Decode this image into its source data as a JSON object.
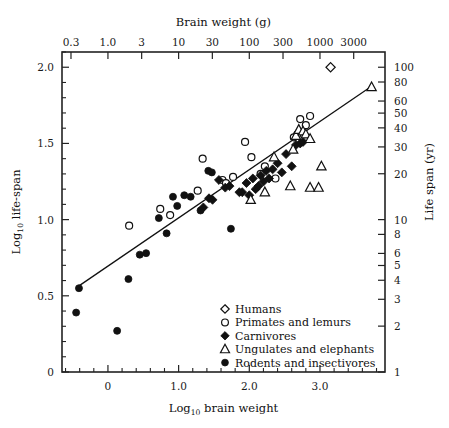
{
  "figure": {
    "background": "#ffffff",
    "ink_color": "#111111"
  },
  "axes": {
    "top": {
      "title": "Brain weight (g)",
      "tick_labels": [
        "0.3",
        "1.0",
        "3",
        "10",
        "30",
        "100",
        "300",
        "1000",
        "3000"
      ],
      "tick_values": [
        0.3,
        1.0,
        3,
        10,
        30,
        100,
        300,
        1000,
        3000
      ],
      "scale": "log10",
      "position": "top"
    },
    "bottom": {
      "title_prefix": "Log",
      "title_sub": "10",
      "title_suffix": " brain weight",
      "title": "Log10 brain weight",
      "tick_labels": [
        "0",
        "1.0",
        "2.0",
        "3.0"
      ],
      "tick_values": [
        0,
        1.0,
        2.0,
        3.0
      ],
      "minor_step": 0.2,
      "range": [
        -0.65,
        3.92
      ],
      "scale": "linear",
      "position": "bottom"
    },
    "left": {
      "title_prefix": "Log",
      "title_sub": "10",
      "title_suffix": " life-span",
      "title": "Log10 life-span",
      "tick_labels": [
        "0",
        "0.5",
        "1.0",
        "1.5",
        "2.0"
      ],
      "tick_values": [
        0,
        0.5,
        1.0,
        1.5,
        2.0
      ],
      "minor_step": 0.1,
      "range": [
        0,
        2.1
      ],
      "scale": "linear",
      "position": "left"
    },
    "right": {
      "title": "Life span (yr)",
      "tick_labels": [
        "100",
        "80",
        "60",
        "50",
        "40",
        "30",
        "20",
        "10",
        "8",
        "6",
        "5",
        "4",
        "3",
        "2",
        "1"
      ],
      "tick_values": [
        100,
        80,
        60,
        50,
        40,
        30,
        20,
        10,
        8,
        6,
        5,
        4,
        3,
        2,
        1
      ],
      "scale": "log10",
      "position": "right"
    }
  },
  "legend": {
    "position": "bottom-right-inside",
    "items": [
      {
        "label": "Humans",
        "marker": "open-diamond",
        "series": "humans"
      },
      {
        "label": "Primates and lemurs",
        "marker": "open-circle",
        "series": "primates"
      },
      {
        "label": "Carnivores",
        "marker": "filled-diamond",
        "series": "carnivores"
      },
      {
        "label": "Ungulates and elephants",
        "marker": "open-triangle",
        "series": "ungulates"
      },
      {
        "label": "Rodents and insectivores",
        "marker": "filled-circle",
        "series": "rodents"
      }
    ]
  },
  "chart_data": {
    "type": "scatter",
    "title": "",
    "xlabel": "Log10 brain weight",
    "ylabel": "Log10 life-span",
    "xlabel_secondary": "Brain weight (g)",
    "ylabel_secondary": "Life span (yr)",
    "xlim": [
      -0.65,
      3.92
    ],
    "ylim": [
      0,
      2.1
    ],
    "grid": false,
    "legend_position": "lower right",
    "trend_line": {
      "label": "regression line",
      "x": [
        -0.41,
        3.73
      ],
      "y": [
        0.565,
        1.875
      ]
    },
    "series": [
      {
        "name": "Humans",
        "marker": "open-diamond",
        "points": [
          [
            3.15,
            2.0
          ]
        ]
      },
      {
        "name": "Primates and lemurs",
        "marker": "open-circle",
        "points": [
          [
            0.3,
            0.96
          ],
          [
            0.74,
            1.07
          ],
          [
            0.88,
            1.03
          ],
          [
            1.27,
            1.19
          ],
          [
            1.34,
            1.4
          ],
          [
            1.62,
            1.26
          ],
          [
            1.67,
            1.24
          ],
          [
            1.77,
            1.28
          ],
          [
            1.94,
            1.51
          ],
          [
            2.03,
            1.41
          ],
          [
            2.16,
            1.3
          ],
          [
            2.22,
            1.35
          ],
          [
            2.37,
            1.27
          ],
          [
            2.63,
            1.54
          ],
          [
            2.68,
            1.56
          ],
          [
            2.72,
            1.66
          ],
          [
            2.8,
            1.62
          ],
          [
            2.86,
            1.68
          ]
        ]
      },
      {
        "name": "Carnivores",
        "marker": "filled-diamond",
        "points": [
          [
            1.48,
            1.13
          ],
          [
            1.57,
            1.26
          ],
          [
            1.66,
            1.21
          ],
          [
            1.72,
            1.22
          ],
          [
            1.86,
            1.18
          ],
          [
            1.9,
            1.18
          ],
          [
            1.96,
            1.24
          ],
          [
            2.05,
            1.27
          ],
          [
            2.09,
            1.2
          ],
          [
            2.13,
            1.22
          ],
          [
            2.16,
            1.29
          ],
          [
            2.2,
            1.25
          ],
          [
            2.24,
            1.32
          ],
          [
            2.28,
            1.27
          ],
          [
            2.33,
            1.33
          ],
          [
            2.4,
            1.37
          ],
          [
            2.46,
            1.31
          ],
          [
            2.52,
            1.43
          ],
          [
            2.6,
            1.35
          ],
          [
            2.66,
            1.49
          ],
          [
            2.72,
            1.5
          ],
          [
            2.76,
            1.51
          ],
          [
            1.35,
            1.08
          ],
          [
            1.43,
            1.14
          ],
          [
            2.0,
            1.16
          ]
        ]
      },
      {
        "name": "Ungulates and elephants",
        "marker": "open-triangle",
        "points": [
          [
            2.02,
            1.13
          ],
          [
            2.22,
            1.18
          ],
          [
            2.35,
            1.41
          ],
          [
            2.62,
            1.46
          ],
          [
            2.66,
            1.55
          ],
          [
            2.7,
            1.59
          ],
          [
            2.76,
            1.58
          ],
          [
            2.8,
            1.56
          ],
          [
            2.86,
            1.53
          ],
          [
            2.58,
            1.22
          ],
          [
            2.86,
            1.21
          ],
          [
            2.98,
            1.21
          ],
          [
            3.02,
            1.35
          ],
          [
            3.73,
            1.87
          ]
        ]
      },
      {
        "name": "Rodents and insectivores",
        "marker": "filled-circle",
        "points": [
          [
            -0.45,
            0.39
          ],
          [
            -0.41,
            0.55
          ],
          [
            0.13,
            0.27
          ],
          [
            0.29,
            0.61
          ],
          [
            0.45,
            0.77
          ],
          [
            0.54,
            0.78
          ],
          [
            0.72,
            1.01
          ],
          [
            0.83,
            0.91
          ],
          [
            0.92,
            1.15
          ],
          [
            1.08,
            1.16
          ],
          [
            1.17,
            1.15
          ],
          [
            1.31,
            1.06
          ],
          [
            1.42,
            1.32
          ],
          [
            1.47,
            1.31
          ],
          [
            1.74,
            0.94
          ],
          [
            0.98,
            1.09
          ]
        ]
      }
    ]
  }
}
